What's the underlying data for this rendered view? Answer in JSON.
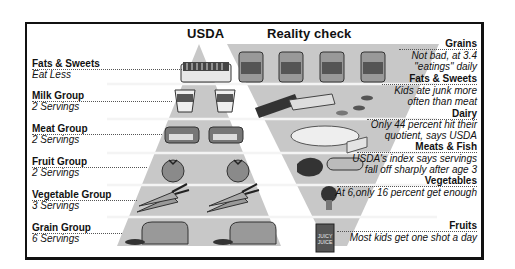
{
  "left": {
    "title": "USDA",
    "groups": [
      {
        "name": "Fats & Sweets",
        "servings": "Eat Less",
        "item": "butter"
      },
      {
        "name": "Milk Group",
        "servings": "2 Servings",
        "item": "milk-cartons"
      },
      {
        "name": "Meat Group",
        "servings": "2 Servings",
        "item": "tuna-cans"
      },
      {
        "name": "Fruit Group",
        "servings": "2 Servings",
        "item": "tomatoes"
      },
      {
        "name": "Vegetable Group",
        "servings": "3 Servings",
        "item": "carrots"
      },
      {
        "name": "Grain Group",
        "servings": "6 Servings",
        "item": "bread-loaves"
      }
    ]
  },
  "right": {
    "title": "Reality check",
    "groups": [
      {
        "name": "Grains",
        "lines": [
          "Not bad, at 3.4",
          "\"eatings\" daily"
        ],
        "item": "spaghetti-cans"
      },
      {
        "name": "Fats & Sweets",
        "lines": [
          "Kids ate junk more",
          "often than meat"
        ],
        "item": "candy-bar"
      },
      {
        "name": "Dairy",
        "lines": [
          "Only 44 percent hit their",
          "quotient, says USDA"
        ],
        "item": "cheese"
      },
      {
        "name": "Meats & Fish",
        "lines": [
          "USDA's index says servings",
          "fall off sharply after age 3"
        ],
        "item": "meat-and-hotdog"
      },
      {
        "name": "Vegetables",
        "lines": [
          "At 6,only 16 percent get enough"
        ],
        "item": "broccoli"
      },
      {
        "name": "Fruits",
        "lines": [
          "Most kids get one shot a day"
        ],
        "item": "juice-box"
      }
    ],
    "labels_on_items": {
      "candy": "Gummy",
      "chocolate": "Chocolate",
      "juice": "JUICY JUICE",
      "tuna": "Tuna",
      "milk": "Milk"
    }
  },
  "colors": {
    "pyramid": "#c9c9c9",
    "band_line": "#f2f2f2",
    "frame": "#111111",
    "item_dark": "#333333"
  }
}
